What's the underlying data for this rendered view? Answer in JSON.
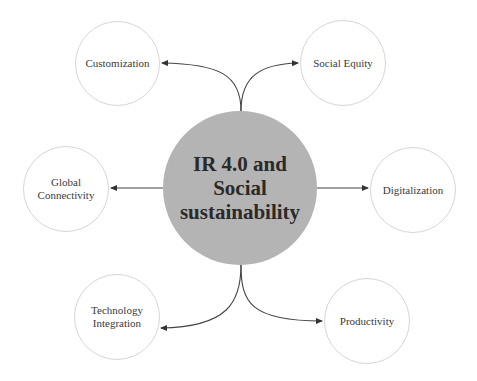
{
  "diagram": {
    "center": {
      "label": "IR 4.0 and\nSocial\nsustainability",
      "color": "#b4b4b4"
    },
    "nodes": [
      {
        "id": "customization",
        "label": "Customization"
      },
      {
        "id": "social-equity",
        "label": "Social Equity"
      },
      {
        "id": "global-connectivity",
        "label": "Global\nConnectivity"
      },
      {
        "id": "digitalization",
        "label": "Digitalization"
      },
      {
        "id": "technology-integration",
        "label": "Technology\nIntegration"
      },
      {
        "id": "productivity",
        "label": "Productivity"
      }
    ],
    "edges": [
      {
        "from": "center",
        "to": "customization"
      },
      {
        "from": "center",
        "to": "social-equity"
      },
      {
        "from": "center",
        "to": "global-connectivity"
      },
      {
        "from": "center",
        "to": "digitalization"
      },
      {
        "from": "center",
        "to": "technology-integration"
      },
      {
        "from": "center",
        "to": "productivity"
      }
    ]
  }
}
